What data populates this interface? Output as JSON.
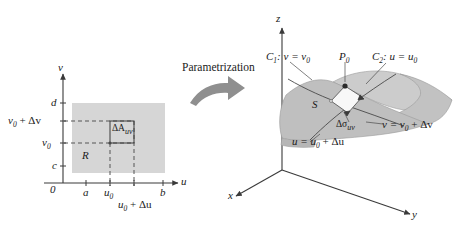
{
  "figure": {
    "transform_label": "Parametrization",
    "colors": {
      "region_fill": "#d4d4d4",
      "surface_front": "#bdbdbd",
      "surface_back": "#cfcfcf",
      "patch_fill": "#f7f7f7",
      "axis": "#3a3a3a",
      "arrow_gray": "#8c8c8c",
      "text": "#1a1a1a"
    }
  },
  "uv_plane": {
    "axis_v_label": "v",
    "axis_u_label": "u",
    "origin_label": "0",
    "region_label": "R",
    "area_element_label": "ΔA",
    "area_element_sub": "uv",
    "u_ticks": [
      {
        "label": "a"
      },
      {
        "label": "u",
        "sub": "0"
      },
      {
        "label": "u",
        "sub": "0",
        "suffix": " + Δu"
      },
      {
        "label": "b"
      }
    ],
    "v_ticks": [
      {
        "label": "c"
      },
      {
        "label": "v",
        "sub": "0"
      },
      {
        "label": "v",
        "sub": "0",
        "suffix": " + Δv"
      },
      {
        "label": "d"
      }
    ],
    "tick_a": "a",
    "tick_b": "b",
    "tick_c": "c",
    "tick_d": "d",
    "tick_u0": "u",
    "tick_u0_sub": "0",
    "tick_u0_du": "u",
    "tick_u0_du_sub": "0",
    "tick_u0_du_rest": " + Δu",
    "tick_v0": "v",
    "tick_v0_sub": "0",
    "tick_v0_dv": "v",
    "tick_v0_dv_sub": "0",
    "tick_v0_dv_rest": " + Δv"
  },
  "xyz_space": {
    "axis_x_label": "x",
    "axis_y_label": "y",
    "axis_z_label": "z",
    "surface_label": "S",
    "point_label": "P",
    "point_sub": "0",
    "curve1": "C",
    "curve1_sub": "1",
    "curve1_rest": ": v = v",
    "curve1_rest_sub": "0",
    "curve2": "C",
    "curve2_sub": "2",
    "curve2_rest": ": u = u",
    "curve2_rest_sub": "0",
    "patch_label": "Δσ",
    "patch_sub": "uv",
    "edge_v": "v = v",
    "edge_v_sub": "0",
    "edge_v_rest": " + Δv",
    "edge_u": "u = u",
    "edge_u_sub": "0",
    "edge_u_rest": " + Δu"
  }
}
